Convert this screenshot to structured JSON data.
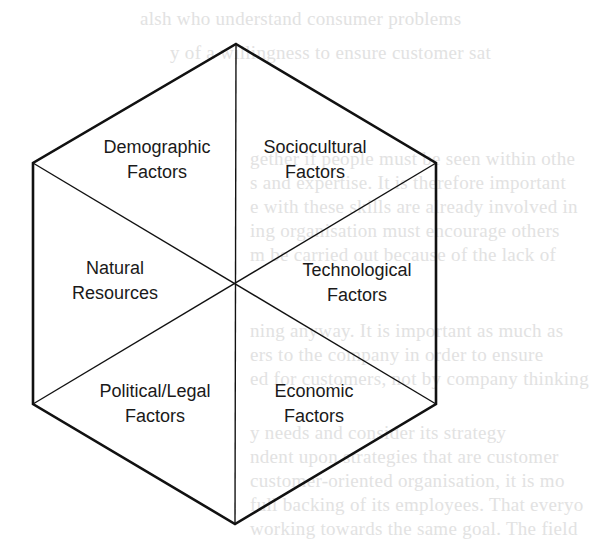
{
  "diagram": {
    "type": "hexagon-environment-model",
    "stroke_color": "#111111",
    "background_color": "#ffffff",
    "vertices": {
      "top": [
        236,
        44
      ],
      "upper_right": [
        436,
        163
      ],
      "lower_right": [
        436,
        404
      ],
      "bottom": [
        236,
        524
      ],
      "lower_left": [
        33,
        404
      ],
      "upper_left": [
        33,
        163
      ]
    },
    "center": [
      236,
      284
    ],
    "segments": [
      {
        "id": "demographic",
        "line1": "Demographic",
        "line2": "Factors",
        "x": 157,
        "y": 135
      },
      {
        "id": "sociocultural",
        "line1": "Sociocultural",
        "line2": "Factors",
        "x": 315,
        "y": 135
      },
      {
        "id": "natural",
        "line1": "Natural",
        "line2": "Resources",
        "x": 115,
        "y": 256
      },
      {
        "id": "technological",
        "line1": "Technological",
        "line2": "Factors",
        "x": 357,
        "y": 258
      },
      {
        "id": "political",
        "line1": "Political/Legal",
        "line2": "Factors",
        "x": 155,
        "y": 379
      },
      {
        "id": "economic",
        "line1": "Economic",
        "line2": "Factors",
        "x": 314,
        "y": 379
      }
    ]
  },
  "bleed_through_text": [
    {
      "text": "alsh who understand consumer problems",
      "x": 140,
      "y": 8
    },
    {
      "text": "y of a willingness to ensure customer sat",
      "x": 170,
      "y": 42
    },
    {
      "text": "gether if people must be seen within othe",
      "x": 250,
      "y": 148
    },
    {
      "text": "s and expertise. It is therefore important",
      "x": 250,
      "y": 172
    },
    {
      "text": "e with these skills are already involved in",
      "x": 250,
      "y": 196
    },
    {
      "text": "ing organisation must encourage others",
      "x": 250,
      "y": 220
    },
    {
      "text": "m be carried out because of the lack of",
      "x": 250,
      "y": 244
    },
    {
      "text": "ning anyway. It is important as much as",
      "x": 250,
      "y": 320
    },
    {
      "text": "ers to the company in order to ensure",
      "x": 250,
      "y": 344
    },
    {
      "text": "ed for customers, not by company thinking",
      "x": 250,
      "y": 368
    },
    {
      "text": "y needs and consider its strategy",
      "x": 250,
      "y": 422
    },
    {
      "text": "ndent upon strategies that are customer",
      "x": 250,
      "y": 446
    },
    {
      "text": "customer-oriented organisation, it is mo",
      "x": 250,
      "y": 470
    },
    {
      "text": "full backing of its employees. That everyo",
      "x": 250,
      "y": 494
    },
    {
      "text": "working towards the same goal. The field",
      "x": 250,
      "y": 518
    }
  ]
}
